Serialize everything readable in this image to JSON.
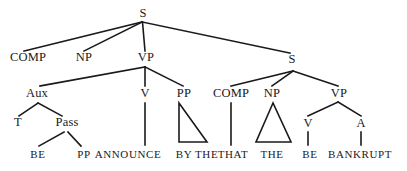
{
  "figure": {
    "kind": "syntax-tree",
    "line_color": "#1a1a1a",
    "text_color": "#1a1a1a",
    "background_color": "#ffffff"
  },
  "nodes": {
    "root_s": "S",
    "comp_main": "COMP",
    "np_main": "NP",
    "vp_main": "VP",
    "s_embedded": "S",
    "aux": "Aux",
    "v_main": "V",
    "pp_main": "PP",
    "comp_embedded": "COMP",
    "np_embedded": "NP",
    "vp_embedded": "VP",
    "t": "T",
    "pass": "Pass",
    "v_embedded": "V",
    "a_embedded": "A"
  },
  "terminals": {
    "be_pass": "BE",
    "pp_pass": "PP",
    "announce": "ANNOUNCE",
    "by_the": "BY THE",
    "that": "THAT",
    "the": "THE",
    "be_emb": "BE",
    "bankrupt": "BANKRUPT"
  }
}
